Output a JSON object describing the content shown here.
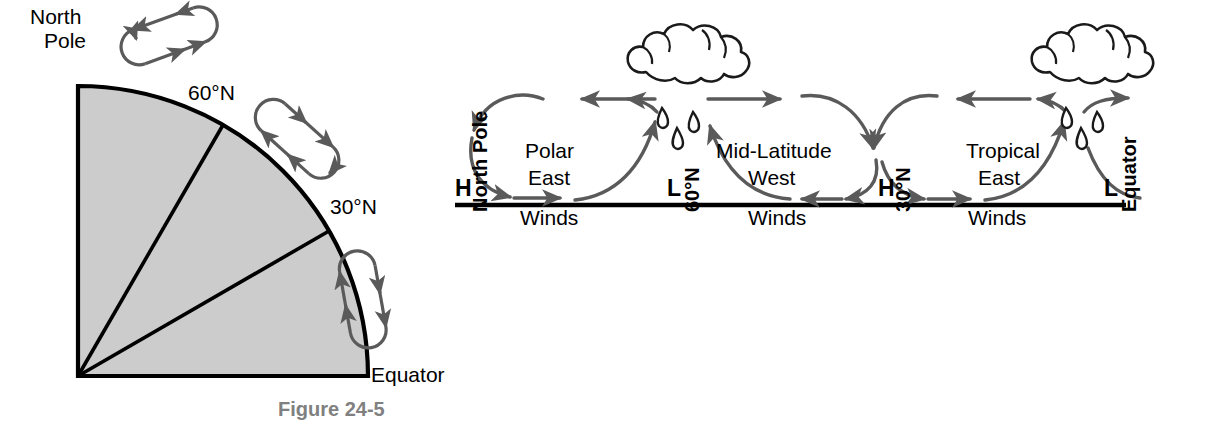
{
  "figure": {
    "caption": "Figure 24-5"
  },
  "left_panel": {
    "name": "earth-quadrant-cross-section",
    "labels": {
      "north_pole_line1": "North",
      "north_pole_line2": "Pole",
      "lat60": "60°N",
      "lat30": "30°N",
      "equator": "Equator"
    },
    "cells": [
      {
        "name": "polar-cell-loop",
        "latitude_band": "60°N to North Pole",
        "rotation_deg": -22
      },
      {
        "name": "mid-latitude-cell-loop",
        "latitude_band": "30°N to 60°N",
        "rotation_deg": 40
      },
      {
        "name": "tropical-cell-loop",
        "latitude_band": "Equator to 30°N",
        "rotation_deg": 80
      }
    ],
    "geometry": {
      "fill_color": "#cccccc",
      "outline_color": "#000000",
      "radius_px": 290,
      "boundary_angles_deg": [
        30,
        60
      ]
    }
  },
  "right_panel": {
    "name": "global-wind-belt-diagram",
    "boundary_markers": [
      {
        "key": "north-pole",
        "pressure": "H",
        "label": "North Pole"
      },
      {
        "key": "lat-60n",
        "pressure": "L",
        "label": "60°N"
      },
      {
        "key": "lat-30n",
        "pressure": "H",
        "label": "30°N"
      },
      {
        "key": "equator",
        "pressure": "L",
        "label": "Equator"
      }
    ],
    "wind_belts": [
      {
        "key": "polar-easterlies",
        "line1": "Polar",
        "line2": "East",
        "line3": "Winds"
      },
      {
        "key": "mid-latitude-westerlies",
        "line1": "Mid-Latitude",
        "line2": "West",
        "line3": "Winds"
      },
      {
        "key": "tropical-easterlies",
        "line1": "Tropical",
        "line2": "East",
        "line3": "Winds"
      }
    ],
    "clouds": [
      {
        "key": "cloud-60n",
        "raindrop_count": 3
      },
      {
        "key": "cloud-equator",
        "raindrop_count": 3
      }
    ],
    "colors": {
      "arrow": "#5a5a5a",
      "ground_line": "#000000",
      "cloud_outline": "#1a1a1a"
    }
  }
}
